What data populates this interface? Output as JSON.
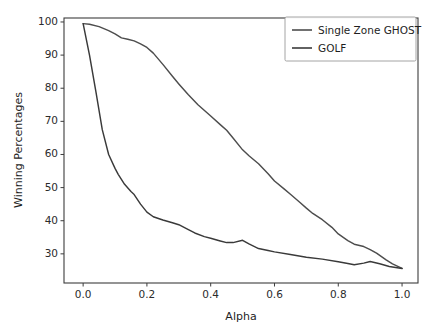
{
  "chart_data": {
    "type": "line",
    "title": "",
    "xlabel": "Alpha",
    "ylabel": "Winning Percentages",
    "xlim": [
      -0.06,
      1.05
    ],
    "ylim": [
      21.2,
      101.2
    ],
    "grid": false,
    "legend_position": "upper right",
    "xticks": [
      0.0,
      0.2,
      0.4,
      0.6,
      0.8,
      1.0
    ],
    "xticklabels": [
      "0.0",
      "0.2",
      "0.4",
      "0.6",
      "0.8",
      "1.0"
    ],
    "yticks": [
      30,
      40,
      50,
      60,
      70,
      80,
      90,
      100
    ],
    "yticklabels": [
      "30",
      "40",
      "50",
      "60",
      "70",
      "80",
      "90",
      "100"
    ],
    "series": [
      {
        "name": "Single Zone GHOST",
        "color": "#4d4d4d",
        "x": [
          0.0,
          0.02,
          0.05,
          0.08,
          0.1,
          0.12,
          0.14,
          0.16,
          0.18,
          0.2,
          0.22,
          0.25,
          0.28,
          0.3,
          0.33,
          0.36,
          0.4,
          0.43,
          0.45,
          0.47,
          0.5,
          0.52,
          0.55,
          0.58,
          0.6,
          0.63,
          0.65,
          0.68,
          0.7,
          0.72,
          0.75,
          0.78,
          0.8,
          0.83,
          0.85,
          0.88,
          0.9,
          0.92,
          0.95,
          0.97,
          1.0
        ],
        "y": [
          99.5,
          99.3,
          98.6,
          97.4,
          96.4,
          95.2,
          94.8,
          94.3,
          93.4,
          92.3,
          90.6,
          87.2,
          83.6,
          81.3,
          78.0,
          75.0,
          71.6,
          69.0,
          67.3,
          65.0,
          61.4,
          59.6,
          57.2,
          54.2,
          52.0,
          49.6,
          48.0,
          45.5,
          43.8,
          42.2,
          40.3,
          38.0,
          36.0,
          34.0,
          32.9,
          32.2,
          31.3,
          30.2,
          28.2,
          27.0,
          25.6
        ]
      },
      {
        "name": "GOLF",
        "color": "#3a3a3a",
        "x": [
          0.0,
          0.02,
          0.04,
          0.06,
          0.08,
          0.1,
          0.11,
          0.13,
          0.15,
          0.16,
          0.18,
          0.2,
          0.22,
          0.25,
          0.28,
          0.3,
          0.33,
          0.35,
          0.38,
          0.4,
          0.43,
          0.45,
          0.47,
          0.5,
          0.52,
          0.55,
          0.58,
          0.6,
          0.65,
          0.7,
          0.75,
          0.8,
          0.83,
          0.85,
          0.88,
          0.9,
          0.93,
          0.96,
          1.0
        ],
        "y": [
          99.5,
          90.0,
          79.0,
          67.5,
          60.0,
          55.8,
          54.0,
          51.0,
          48.8,
          47.9,
          45.0,
          42.6,
          41.2,
          40.2,
          39.4,
          38.8,
          37.3,
          36.3,
          35.2,
          34.7,
          33.9,
          33.4,
          33.4,
          34.1,
          33.0,
          31.6,
          31.0,
          30.6,
          29.8,
          29.0,
          28.4,
          27.6,
          27.1,
          26.7,
          27.2,
          27.7,
          27.0,
          26.2,
          25.6
        ]
      }
    ]
  },
  "legend": {
    "entries": [
      {
        "label": "Single Zone GHOST"
      },
      {
        "label": "GOLF"
      }
    ]
  },
  "axes": {
    "x_label": "Alpha",
    "y_label": "Winning Percentages"
  }
}
